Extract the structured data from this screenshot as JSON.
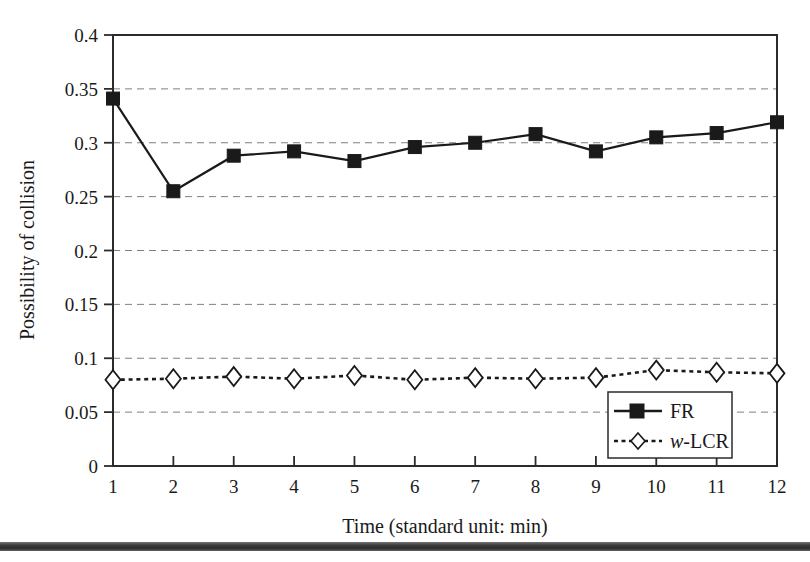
{
  "figure": {
    "background_color": "#ffffff",
    "ink_color": "#1a1a1a",
    "grid_color": "#808080",
    "plot_area": {
      "left": 113,
      "top": 35,
      "right": 777,
      "bottom": 466
    }
  },
  "chart_data": {
    "type": "line",
    "title": "",
    "xlabel": "Time (standard unit: min)",
    "ylabel": "Possibility of collision",
    "x": [
      1,
      2,
      3,
      4,
      5,
      6,
      7,
      8,
      9,
      10,
      11,
      12
    ],
    "categories": [
      "1",
      "2",
      "3",
      "4",
      "5",
      "6",
      "7",
      "8",
      "9",
      "10",
      "11",
      "12"
    ],
    "xtick_labels": [
      "1",
      "2",
      "3",
      "4",
      "5",
      "6",
      "7",
      "8",
      "9",
      "10",
      "11",
      "12"
    ],
    "ytick_labels": [
      "0",
      "0.05",
      "0.1",
      "0.15",
      "0.2",
      "0.25",
      "0.3",
      "0.35",
      "0.4"
    ],
    "ytick_values": [
      0,
      0.05,
      0.1,
      0.15,
      0.2,
      0.25,
      0.3,
      0.35,
      0.4
    ],
    "ylim": [
      0,
      0.4
    ],
    "xlim": [
      1,
      12
    ],
    "grid": "horizontal-dashed",
    "legend_position": "bottom-right",
    "series": [
      {
        "name": "FR",
        "marker": "filled-square",
        "line_style": "solid",
        "color": "#1a1a1a",
        "values": [
          0.341,
          0.255,
          0.288,
          0.292,
          0.283,
          0.296,
          0.3,
          0.308,
          0.292,
          0.305,
          0.309,
          0.319
        ]
      },
      {
        "name": "w-LCR",
        "marker": "open-diamond",
        "line_style": "dotted",
        "color": "#1a1a1a",
        "values": [
          0.08,
          0.081,
          0.083,
          0.081,
          0.084,
          0.08,
          0.082,
          0.081,
          0.082,
          0.089,
          0.087,
          0.086
        ]
      }
    ]
  },
  "legend": {
    "entries": [
      {
        "label": "FR",
        "label_prefix": "",
        "marker": "filled-square",
        "line_style": "solid"
      },
      {
        "label": "-LCR",
        "label_prefix": "w",
        "marker": "open-diamond",
        "line_style": "dotted"
      }
    ]
  }
}
